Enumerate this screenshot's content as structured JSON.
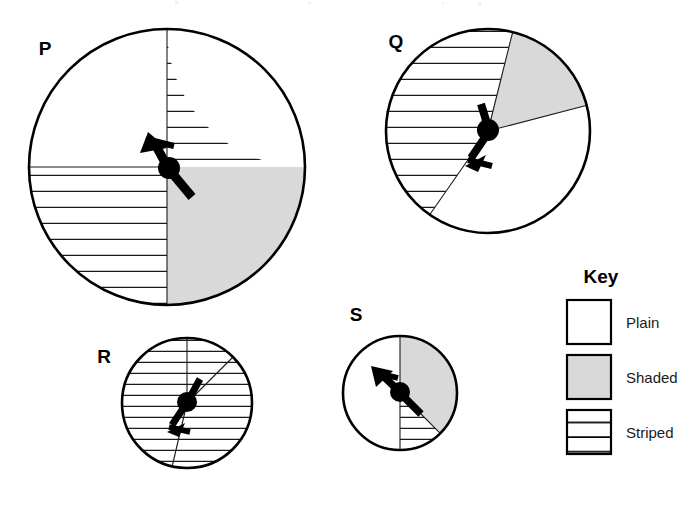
{
  "figure": {
    "background_color": "#ffffff",
    "outline_color": "#000000",
    "shaded_color": "#d9d9d9",
    "plain_color": "#ffffff",
    "stripe_color": "#1a1a1a"
  },
  "spinners": [
    {
      "id": "P",
      "label": "P",
      "label_x": 45,
      "label_y": 55,
      "center_x": 167,
      "center_y": 167,
      "radius": 138,
      "needle_angle_deg": 118,
      "regions": [
        {
          "name": "plain-quadrant-top-left",
          "fill": "plain",
          "start_deg": 90,
          "end_deg": 180
        },
        {
          "name": "striped-quadrant-top-right",
          "fill": "striped",
          "start_deg": 0,
          "end_deg": 90
        },
        {
          "name": "striped-quadrant-bottom-left",
          "fill": "striped",
          "start_deg": 180,
          "end_deg": 270
        },
        {
          "name": "shaded-quadrant-bottom-right",
          "fill": "shaded",
          "start_deg": 270,
          "end_deg": 360
        }
      ]
    },
    {
      "id": "Q",
      "label": "Q",
      "label_x": 396,
      "label_y": 48,
      "center_x": 488,
      "center_y": 131,
      "radius": 102,
      "needle_angle_deg": 112,
      "regions": [
        {
          "name": "striped-region",
          "fill": "striped",
          "start_deg": 76,
          "end_deg": 235
        },
        {
          "name": "shaded-wedge",
          "fill": "shaded",
          "start_deg": 14,
          "end_deg": 76
        },
        {
          "name": "plain-region",
          "fill": "plain",
          "start_deg": 235,
          "end_deg": 374
        }
      ]
    },
    {
      "id": "R",
      "label": "R",
      "label_x": 104,
      "label_y": 363,
      "center_x": 187,
      "center_y": 403,
      "radius": 65,
      "needle_angle_deg": 118,
      "regions": [
        {
          "name": "striped-region-left",
          "fill": "striped",
          "start_deg": 90,
          "end_deg": 257
        },
        {
          "name": "striped-region-right",
          "fill": "striped",
          "start_deg": 257,
          "end_deg": 405
        },
        {
          "name": "plain-wedge-upper",
          "fill": "striped",
          "start_deg": 45,
          "end_deg": 90
        }
      ]
    },
    {
      "id": "S",
      "label": "S",
      "label_x": 356,
      "label_y": 321,
      "center_x": 400,
      "center_y": 393,
      "radius": 57,
      "needle_angle_deg": 128,
      "regions": [
        {
          "name": "plain-half-left",
          "fill": "plain",
          "start_deg": 90,
          "end_deg": 270
        },
        {
          "name": "shaded-region-right",
          "fill": "shaded",
          "start_deg": 315,
          "end_deg": 450
        },
        {
          "name": "striped-wedge",
          "fill": "striped",
          "start_deg": 270,
          "end_deg": 315
        }
      ]
    }
  ],
  "key": {
    "title": "Key",
    "title_x": 601,
    "title_y": 283,
    "items": [
      {
        "label": "Plain",
        "fill": "plain",
        "swatch_x": 567,
        "swatch_y": 300
      },
      {
        "label": "Shaded",
        "fill": "shaded",
        "swatch_x": 567,
        "swatch_y": 355
      },
      {
        "label": "Striped",
        "fill": "striped",
        "swatch_x": 567,
        "swatch_y": 410
      }
    ],
    "swatch_size": 44
  }
}
